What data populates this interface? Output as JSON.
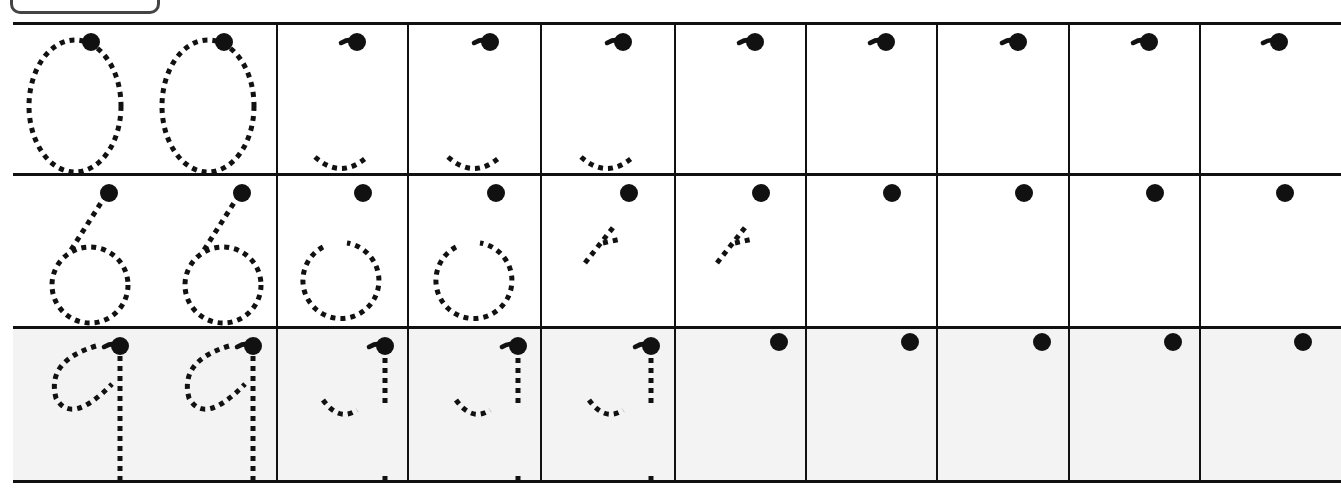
{
  "worksheet": {
    "type": "number-tracing",
    "header_box": {
      "label": ""
    },
    "grid": {
      "rows": 3,
      "columns": 10,
      "line_color": "#111111",
      "dot_color": "#111111"
    },
    "rows": [
      {
        "digit": "0",
        "model_count": 2,
        "partial_guide_count": 3,
        "start_dot_only_count": 5,
        "partial_guide": "bottom-arc",
        "start_marker": "dot-with-hook"
      },
      {
        "digit": "6",
        "model_count": 2,
        "partial_guide_count": 4,
        "start_dot_only_count": 4,
        "partial_guide": [
          "open-circle",
          "open-circle",
          "diagonal-stroke",
          "diagonal-stroke"
        ],
        "start_marker": "dot"
      },
      {
        "digit": "9",
        "model_count": 2,
        "partial_guide_count": 3,
        "start_dot_only_count": 5,
        "partial_guide": "hook-loop-fragment",
        "start_marker": "dot-with-hook"
      }
    ]
  }
}
